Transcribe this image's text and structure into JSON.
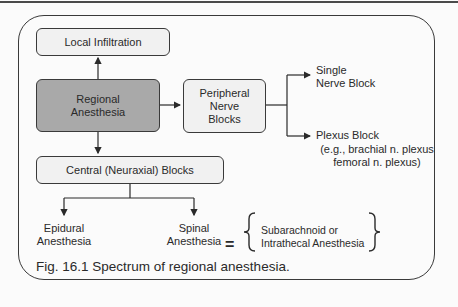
{
  "diagram": {
    "nodes": {
      "local_infiltration": "Local Infiltration",
      "regional_anesthesia": "Regional\nAnesthesia",
      "peripheral_nerve_blocks": "Peripheral\nNerve\nBlocks",
      "central_blocks": "Central (Neuraxial) Blocks",
      "single_nerve_block": "Single\nNerve Block",
      "plexus_block_title": "Plexus Block",
      "plexus_block_examples": "(e.g., brachial n. plexus\nfemoral n. plexus)",
      "epidural": "Epidural\nAnesthesia",
      "spinal": "Spinal\nAnesthesia",
      "equals": "=",
      "spinal_synonyms": "Subarachnoid or\nIntrathecal Anesthesia"
    },
    "edges": [
      {
        "from": "Regional Anesthesia",
        "to": "Local Infiltration"
      },
      {
        "from": "Regional Anesthesia",
        "to": "Peripheral Nerve Blocks"
      },
      {
        "from": "Regional Anesthesia",
        "to": "Central (Neuraxial) Blocks"
      },
      {
        "from": "Peripheral Nerve Blocks",
        "to": "Single Nerve Block"
      },
      {
        "from": "Peripheral Nerve Blocks",
        "to": "Plexus Block"
      },
      {
        "from": "Central (Neuraxial) Blocks",
        "to": "Epidural Anesthesia"
      },
      {
        "from": "Central (Neuraxial) Blocks",
        "to": "Spinal Anesthesia"
      }
    ],
    "caption": "Fig. 16.1 Spectrum of regional anesthesia.",
    "colors": {
      "highlight_box": "#a9a9a9",
      "light_box": "#f1f1f1",
      "stroke": "#3a3a3a"
    }
  }
}
